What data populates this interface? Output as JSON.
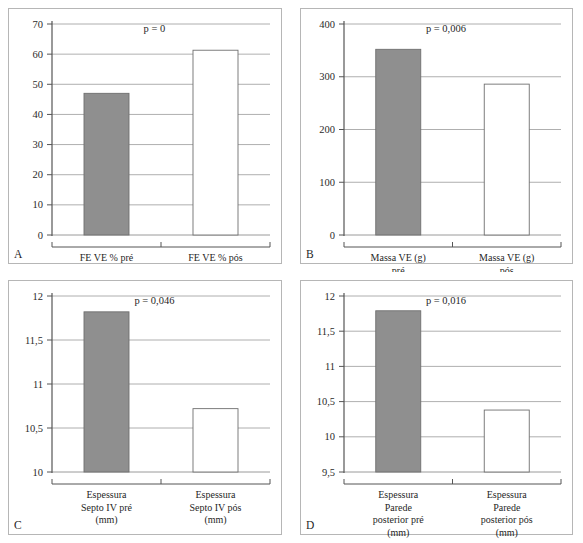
{
  "figure": {
    "background": "#ffffff",
    "panel_border_color": "#b6b6b6",
    "gridline_color": "#9a9a9a",
    "axis_color": "#555555",
    "bar_fill_gray": "#8f8f8f",
    "bar_fill_white": "#ffffff",
    "bar_stroke": "#6f6f6f"
  },
  "panels": [
    {
      "letter": "A",
      "p_label": "p = 0",
      "chart_data": {
        "type": "bar",
        "title": "",
        "xlabel": "",
        "ylabel": "",
        "ylim": [
          0,
          70
        ],
        "yticks": [
          0,
          10,
          20,
          30,
          40,
          50,
          60,
          70
        ],
        "ytick_labels": [
          "0",
          "10",
          "20",
          "30",
          "40",
          "50",
          "60",
          "70"
        ],
        "grid": true,
        "legend": "none",
        "categories": [
          "FE VE % pré",
          "FE VE % pós"
        ],
        "category_lines": [
          [
            "FE VE % pré"
          ],
          [
            "FE VE % pós"
          ]
        ],
        "values": [
          47,
          61.3
        ],
        "bar_colors": [
          "#8f8f8f",
          "#ffffff"
        ],
        "annotations": [
          "p = 0"
        ]
      }
    },
    {
      "letter": "B",
      "p_label": "p = 0,006",
      "chart_data": {
        "type": "bar",
        "title": "",
        "xlabel": "",
        "ylabel": "",
        "ylim": [
          0,
          400
        ],
        "yticks": [
          0,
          100,
          200,
          300,
          400
        ],
        "ytick_labels": [
          "0",
          "100",
          "200",
          "300",
          "400"
        ],
        "grid": true,
        "legend": "none",
        "categories": [
          "Massa VE (g) pré",
          "Massa VE (g) pós"
        ],
        "category_lines": [
          [
            "Massa VE (g)",
            "pré"
          ],
          [
            "Massa VE (g)",
            "pós"
          ]
        ],
        "values": [
          352,
          286
        ],
        "bar_colors": [
          "#8f8f8f",
          "#ffffff"
        ],
        "annotations": [
          "p = 0,006"
        ]
      }
    },
    {
      "letter": "C",
      "p_label": "p = 0,046",
      "chart_data": {
        "type": "bar",
        "title": "",
        "xlabel": "",
        "ylabel": "",
        "ylim": [
          10,
          12
        ],
        "yticks": [
          10,
          10.5,
          11,
          11.5,
          12
        ],
        "ytick_labels": [
          "10",
          "10,5",
          "11",
          "11,5",
          "12"
        ],
        "grid": true,
        "legend": "none",
        "categories": [
          "Espessura Septo IV pré (mm)",
          "Espessura Septo IV pós (mm)"
        ],
        "category_lines": [
          [
            "Espessura",
            "Septo IV pré",
            "(mm)"
          ],
          [
            "Espessura",
            "Septo IV pós",
            "(mm)"
          ]
        ],
        "values": [
          11.82,
          10.72
        ],
        "bar_colors": [
          "#8f8f8f",
          "#ffffff"
        ],
        "annotations": [
          "p = 0,046"
        ]
      }
    },
    {
      "letter": "D",
      "p_label": "p = 0,016",
      "chart_data": {
        "type": "bar",
        "title": "",
        "xlabel": "",
        "ylabel": "",
        "ylim": [
          9.5,
          12
        ],
        "yticks": [
          9.5,
          10,
          10.5,
          11,
          11.5,
          12
        ],
        "ytick_labels": [
          "9,5",
          "10",
          "10,5",
          "11",
          "11,5",
          "12"
        ],
        "grid": true,
        "legend": "none",
        "categories": [
          "Espessura Parede posterior pré (mm)",
          "Espessura Parede posterior pós (mm)"
        ],
        "category_lines": [
          [
            "Espessura",
            "Parede",
            "posterior pré",
            "(mm)"
          ],
          [
            "Espessura",
            "Parede",
            "posterior pós",
            "(mm)"
          ]
        ],
        "values": [
          11.79,
          10.38
        ],
        "bar_colors": [
          "#8f8f8f",
          "#ffffff"
        ],
        "annotations": [
          "p = 0,016"
        ]
      }
    }
  ]
}
